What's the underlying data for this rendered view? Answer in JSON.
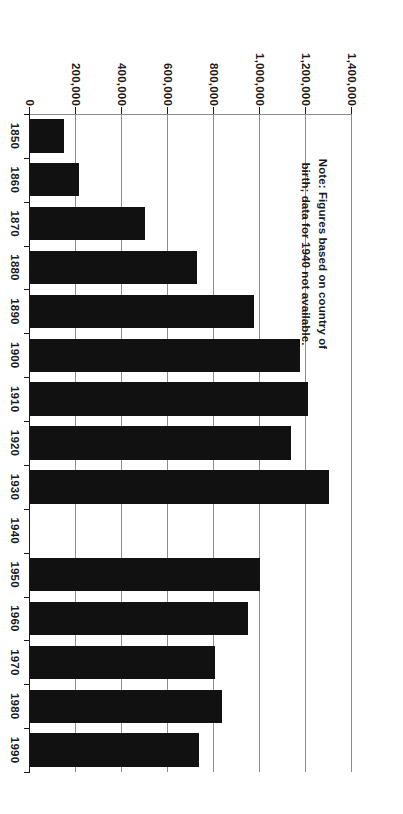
{
  "figure": {
    "kind": "bar-chart",
    "orientation": "page-rotated-90-ccw",
    "note": "Note: Figures based on country of birth; data for 1940 not available.",
    "bar_color": "#111111",
    "grid_color": "#8d8d8d",
    "text_color": "#1a1a1a",
    "background": "#ffffff"
  },
  "chart_data": {
    "type": "bar",
    "title": "",
    "xlabel": "",
    "ylabel": "",
    "categories": [
      "1850",
      "1860",
      "1870",
      "1880",
      "1890",
      "1900",
      "1910",
      "1920",
      "1930",
      "1940",
      "1950",
      "1960",
      "1970",
      "1980",
      "1990"
    ],
    "values": [
      150000,
      215000,
      500000,
      725000,
      975000,
      1175000,
      1210000,
      1135000,
      1300000,
      null,
      1000000,
      950000,
      805000,
      835000,
      735000
    ],
    "ylim": [
      0,
      1400000
    ],
    "ytick_values": [
      0,
      200000,
      400000,
      600000,
      800000,
      1000000,
      1200000,
      1400000
    ],
    "ytick_labels": [
      "0",
      "200,000",
      "400,000",
      "600,000",
      "800,000",
      "1,000,000",
      "1,200,000",
      "1,400,000"
    ],
    "grid": true,
    "grid_axis": "value",
    "legend": null,
    "annotations": [
      "Note: Figures based on country of birth; data for 1940 not available."
    ],
    "missing_categories": [
      "1940"
    ]
  }
}
